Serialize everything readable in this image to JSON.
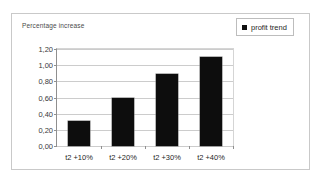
{
  "chart_data": {
    "type": "bar",
    "title": "",
    "ylabel": "Percentage increase",
    "xlabel": "",
    "categories": [
      "t2 +10%",
      "t2 +20%",
      "t2 +30%",
      "t2 +40%"
    ],
    "series": [
      {
        "name": "profit trend",
        "color": "#0d0d0d",
        "values": [
          0.31,
          0.6,
          0.89,
          1.1
        ]
      }
    ],
    "ylim": [
      0.0,
      1.2
    ],
    "ytick_labels": [
      "0,00",
      "0,20",
      "0,40",
      "0,60",
      "0,80",
      "1,00",
      "1,20"
    ],
    "ytick_values": [
      0.0,
      0.2,
      0.4,
      0.6,
      0.8,
      1.0,
      1.2
    ],
    "grid": true,
    "legend_position": "top-right",
    "decimal_separator": ","
  },
  "legend": {
    "entries": [
      {
        "label": "profit trend",
        "swatch_name": "legend-swatch-profit-trend"
      }
    ]
  }
}
